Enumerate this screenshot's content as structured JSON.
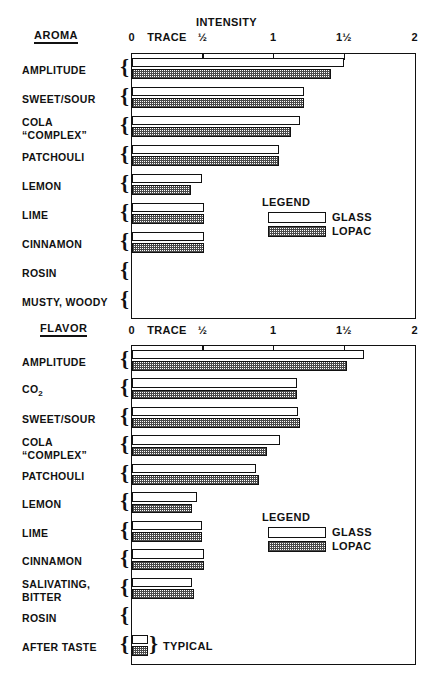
{
  "figure": {
    "axis_title": "INTENSITY",
    "tick_labels": [
      "0",
      "TRACE",
      "½",
      "1",
      "1½",
      "2"
    ],
    "tick_values": [
      0,
      0.25,
      0.5,
      1,
      1.5,
      2
    ]
  },
  "legend": {
    "title": "LEGEND",
    "entries": [
      {
        "label": "GLASS",
        "pattern": "open"
      },
      {
        "label": "LOPAC",
        "pattern": "hatched"
      }
    ]
  },
  "annotations": {
    "typical": "TYPICAL"
  },
  "chart_data": [
    {
      "type": "bar",
      "title": "AROMA",
      "orientation": "horizontal",
      "xlabel": "INTENSITY",
      "ylabel": "",
      "xlim": [
        0,
        2
      ],
      "xticks": [
        0,
        0.5,
        1,
        1.5,
        2
      ],
      "xticklabels": [
        "0",
        "½",
        "1",
        "1½",
        "2"
      ],
      "extra_tick_label": {
        "text": "TRACE",
        "value": 0.25
      },
      "grid": false,
      "legend_position": "inside-right",
      "categories": [
        "AMPLITUDE",
        "SWEET/SOUR",
        "COLA “COMPLEX”",
        "PATCHOULI",
        "LEMON",
        "LIME",
        "CINNAMON",
        "ROSIN",
        "MUSTY, WOODY"
      ],
      "series": [
        {
          "name": "GLASS",
          "values": [
            1.5,
            1.22,
            1.19,
            1.04,
            0.5,
            0.51,
            0.51,
            0.0,
            0.0
          ]
        },
        {
          "name": "LOPAC",
          "values": [
            1.41,
            1.22,
            1.13,
            1.04,
            0.42,
            0.51,
            0.51,
            0.0,
            0.0
          ]
        }
      ]
    },
    {
      "type": "bar",
      "title": "FLAVOR",
      "orientation": "horizontal",
      "xlabel": "INTENSITY",
      "ylabel": "",
      "xlim": [
        0,
        2
      ],
      "xticks": [
        0,
        0.5,
        1,
        1.5,
        2
      ],
      "xticklabels": [
        "0",
        "½",
        "1",
        "1½",
        "2"
      ],
      "extra_tick_label": {
        "text": "TRACE",
        "value": 0.25
      },
      "grid": false,
      "legend_position": "inside-right",
      "categories": [
        "AMPLITUDE",
        "CO2",
        "SWEET/SOUR",
        "COLA “COMPLEX”",
        "PATCHOULI",
        "LEMON",
        "LIME",
        "CINNAMON",
        "SALIVATING, BITTER",
        "ROSIN",
        "AFTER TASTE"
      ],
      "series": [
        {
          "name": "GLASS",
          "values": [
            1.64,
            1.17,
            1.18,
            1.05,
            0.88,
            0.46,
            0.5,
            0.51,
            0.43,
            0.0,
            0.12
          ]
        },
        {
          "name": "LOPAC",
          "values": [
            1.52,
            1.17,
            1.19,
            0.96,
            0.9,
            0.43,
            0.5,
            0.51,
            0.44,
            0.0,
            0.12
          ]
        }
      ]
    }
  ],
  "aroma": {
    "title": "AROMA",
    "rows": [
      {
        "label": "AMPLITUDE"
      },
      {
        "label": "SWEET/SOUR"
      },
      {
        "label_line1": "COLA",
        "label_line2": "“COMPLEX”"
      },
      {
        "label": "PATCHOULI"
      },
      {
        "label": "LEMON"
      },
      {
        "label": "LIME"
      },
      {
        "label": "CINNAMON"
      },
      {
        "label": "ROSIN"
      },
      {
        "label": "MUSTY, WOODY"
      }
    ]
  },
  "flavor": {
    "title": "FLAVOR",
    "rows": [
      {
        "label": "AMPLITUDE"
      },
      {
        "label": "CO",
        "sub": "2"
      },
      {
        "label": "SWEET/SOUR"
      },
      {
        "label_line1": "COLA",
        "label_line2": "“COMPLEX”"
      },
      {
        "label": "PATCHOULI"
      },
      {
        "label": "LEMON"
      },
      {
        "label": "LIME"
      },
      {
        "label": "CINNAMON"
      },
      {
        "label_line1": "SALIVATING,",
        "label_line2": "BITTER"
      },
      {
        "label": "ROSIN"
      },
      {
        "label": "AFTER TASTE"
      }
    ]
  },
  "colors": {
    "ink": "#111111",
    "paper": "#ffffff",
    "hatch": "#4a4a4a"
  }
}
